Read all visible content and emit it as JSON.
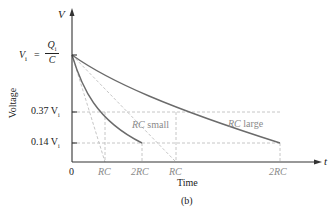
{
  "figure": {
    "caption": "(b)",
    "y_axis_symbol": "V",
    "x_axis_symbol": "t",
    "y_axis_title": "Voltage",
    "x_axis_title": "Time",
    "vi_label_left": "V",
    "vi_label_sub": "i",
    "vi_label_eq": "=",
    "vi_frac_num": "Q",
    "vi_frac_num_sub": "i",
    "vi_frac_den": "C",
    "tick_037": "0.37 V",
    "tick_037_sub": "i",
    "tick_014": "0.14 V",
    "tick_014_sub": "i",
    "x_ticks": [
      "0",
      "RC",
      "2RC",
      "RC",
      "2RC"
    ],
    "curve_labels": [
      "RC small",
      "RC large"
    ],
    "colors": {
      "curve": "#6b6b6b",
      "dashed": "#b5b5b5",
      "axis": "#333333",
      "label_gray": "#8a8a8a"
    }
  },
  "chart_data": {
    "type": "line",
    "title": "",
    "xlabel": "Time",
    "ylabel": "Voltage",
    "y_ticks": [
      "V_i = Q_i/C",
      "0.37 V_i",
      "0.14 V_i"
    ],
    "x_ticks": [
      "0",
      "RC",
      "2RC",
      "RC",
      "2RC"
    ],
    "series": [
      {
        "name": "RC small",
        "description": "V = V_i e^{-t/RC_small}",
        "x_in_RC": [
          0,
          1,
          2
        ],
        "y_over_Vi": [
          1.0,
          0.37,
          0.14
        ]
      },
      {
        "name": "RC large",
        "description": "V = V_i e^{-t/RC_large}",
        "x_in_RC": [
          0,
          1,
          2
        ],
        "y_over_Vi": [
          1.0,
          0.37,
          0.14
        ]
      }
    ],
    "annotations": [
      "Dashed tangent lines from V_i intersecting the t-axis at t = RC for each curve",
      "Dashed horizontal guides at 0.37 V_i and 0.14 V_i"
    ]
  }
}
